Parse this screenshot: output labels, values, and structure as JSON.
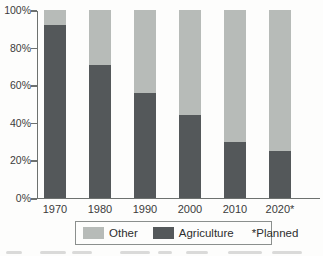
{
  "chart_data": {
    "type": "bar",
    "stacked": true,
    "categories": [
      "1970",
      "1980",
      "1990",
      "2000",
      "2010",
      "2020*"
    ],
    "series": [
      {
        "name": "Agriculture",
        "color": "#54585a",
        "values": [
          92,
          71,
          56,
          44,
          30,
          25
        ]
      },
      {
        "name": "Other",
        "color": "#b7bbb8",
        "values": [
          8,
          29,
          44,
          56,
          70,
          75
        ]
      }
    ],
    "title": "",
    "xlabel": "",
    "ylabel": "",
    "ylim": [
      0,
      100
    ],
    "ytick_labels": [
      "0%",
      "20%",
      "40%",
      "60%",
      "80%",
      "100%"
    ],
    "grid": false,
    "legend_position": "bottom",
    "legend_note": "*Planned"
  },
  "colors": {
    "agriculture": "#54585a",
    "other": "#b7bbb8",
    "axis": "#6d716f",
    "legend_border": "#8b8f8d",
    "text": "#3b3b3b",
    "background": "#fdfdfc"
  }
}
